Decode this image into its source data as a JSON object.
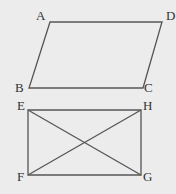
{
  "figures": [
    {
      "name": "parallelogram",
      "vertices": [
        {
          "label": "A",
          "x": 50,
          "y": 22,
          "lx": 36,
          "ly": 20
        },
        {
          "label": "D",
          "x": 162,
          "y": 22,
          "lx": 166,
          "ly": 20
        },
        {
          "label": "C",
          "x": 143,
          "y": 88,
          "lx": 144,
          "ly": 92
        },
        {
          "label": "B",
          "x": 29,
          "y": 88,
          "lx": 15,
          "ly": 92
        }
      ]
    },
    {
      "name": "rectangle",
      "vertices": [
        {
          "label": "E",
          "x": 28,
          "y": 110,
          "lx": 17,
          "ly": 110
        },
        {
          "label": "H",
          "x": 141,
          "y": 110,
          "lx": 143,
          "ly": 110
        },
        {
          "label": "G",
          "x": 141,
          "y": 175,
          "lx": 143,
          "ly": 181
        },
        {
          "label": "F",
          "x": 28,
          "y": 175,
          "lx": 17,
          "ly": 181
        }
      ],
      "diagonals": [
        [
          "E",
          "G"
        ],
        [
          "F",
          "H"
        ]
      ]
    }
  ]
}
